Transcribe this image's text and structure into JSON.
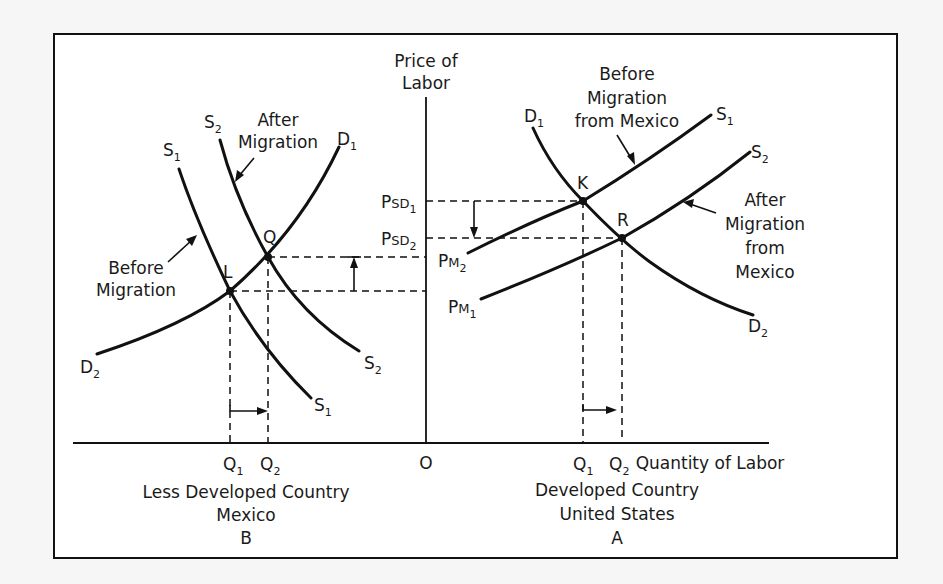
{
  "figure": {
    "y_axis_label_line1": "Price of",
    "y_axis_label_line2": "Labor",
    "x_axis_label": "Quantity of Labor",
    "origin_label": "O"
  },
  "left_panel": {
    "country_line1": "Less Developed Country",
    "country_line2": "Mexico",
    "panel_letter": "B",
    "curves": {
      "s1": {
        "name": "S",
        "sub": "1"
      },
      "s2": {
        "name": "S",
        "sub": "2"
      },
      "d1": {
        "name": "D",
        "sub": "1"
      },
      "d2": {
        "name": "D",
        "sub": "2"
      }
    },
    "after_label_line1": "After",
    "after_label_line2": "Migration",
    "before_label_line1": "Before",
    "before_label_line2": "Migration",
    "points": {
      "q": "Q",
      "l": "L"
    },
    "q1": {
      "name": "Q",
      "sub": "1"
    },
    "q2": {
      "name": "Q",
      "sub": "2"
    }
  },
  "right_panel": {
    "country_line1": "Developed Country",
    "country_line2": "United States",
    "panel_letter": "A",
    "curves": {
      "s1": {
        "name": "S",
        "sub": "1"
      },
      "s2": {
        "name": "S",
        "sub": "2"
      },
      "d1": {
        "name": "D",
        "sub": "1"
      },
      "d2": {
        "name": "D",
        "sub": "2"
      }
    },
    "before_label_line1": "Before",
    "before_label_line2": "Migration",
    "before_label_line3": "from Mexico",
    "after_label_line1": "After",
    "after_label_line2": "Migration",
    "after_label_line3": "from",
    "after_label_line4": "Mexico",
    "points": {
      "k": "K",
      "r": "R"
    },
    "psd1": {
      "name": "P",
      "mid": "SD",
      "sub": "1"
    },
    "psd2": {
      "name": "P",
      "mid": "SD",
      "sub": "2"
    },
    "pm1": {
      "name": "P",
      "mid": "M",
      "sub": "1"
    },
    "pm2": {
      "name": "P",
      "mid": "M",
      "sub": "2"
    },
    "q1": {
      "name": "Q",
      "sub": "1"
    },
    "q2": {
      "name": "Q",
      "sub": "2"
    }
  }
}
